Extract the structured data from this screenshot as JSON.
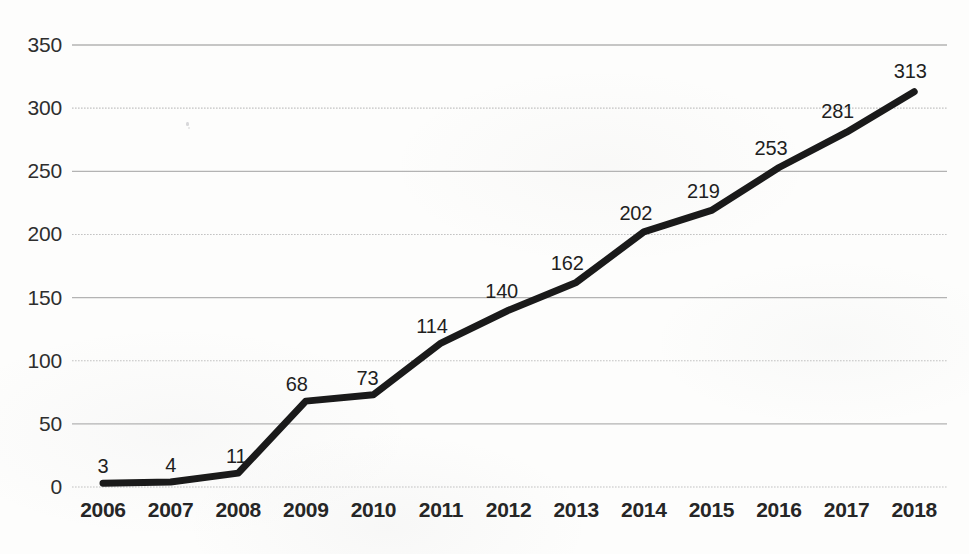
{
  "chart_data": {
    "type": "line",
    "title": "",
    "subtitle": "",
    "xlabel": "",
    "ylabel": "",
    "categories": [
      "2006",
      "2007",
      "2008",
      "2009",
      "2010",
      "2011",
      "2012",
      "2013",
      "2014",
      "2015",
      "2016",
      "2017",
      "2018"
    ],
    "values": [
      3,
      4,
      11,
      68,
      73,
      114,
      140,
      162,
      202,
      219,
      253,
      281,
      313
    ],
    "point_labels": [
      "3",
      "4",
      "11",
      "68",
      "73",
      "114",
      "140",
      "162",
      "202",
      "219",
      "253",
      "281",
      "313"
    ],
    "ylim": [
      0,
      350
    ],
    "ytick_values": [
      0,
      50,
      100,
      150,
      200,
      250,
      300,
      350
    ],
    "ytick_labels": [
      "0",
      "50",
      "100",
      "150",
      "200",
      "250",
      "300",
      "350"
    ],
    "grid": true,
    "grid_axis": "y",
    "legend": "none",
    "series": [
      {
        "name": "",
        "values": [
          3,
          4,
          11,
          68,
          73,
          114,
          140,
          162,
          202,
          219,
          253,
          281,
          313
        ]
      }
    ]
  },
  "style": {
    "line_color": "#1a1a1a",
    "line_width": 7,
    "grid_color": "#b0b0b0",
    "axis_text_color": "#2e2e2e",
    "background": "#fdfdfc"
  },
  "layout": {
    "plot_left": 72,
    "plot_right": 947,
    "plot_top": 45,
    "plot_bottom": 487,
    "first_point_x": 103,
    "x_step": 67.6,
    "y_axis_label_right": 62,
    "x_axis_label_y": 498
  }
}
